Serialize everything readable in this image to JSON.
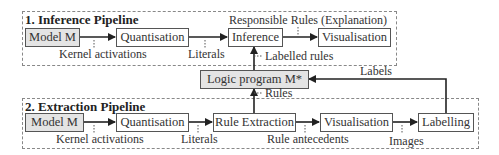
{
  "inference_pipeline": {
    "title": "1. Inference Pipeline",
    "nodes": {
      "model": "Model M",
      "quantisation": "Quantisation",
      "inference": "Inference",
      "visualisation": "Visualisation"
    },
    "edge_labels": {
      "kernel_activations": "Kernel activations",
      "literals": "Literals",
      "responsible_rules": "Responsible Rules (Explanation)"
    }
  },
  "logic_program": {
    "label": "Logic program M*",
    "labelled_rules": "Labelled rules",
    "rules": "Rules",
    "labels": "Labels"
  },
  "extraction_pipeline": {
    "title": "2. Extraction Pipeline",
    "nodes": {
      "model": "Model M",
      "quantisation": "Quantisation",
      "rule_extraction": "Rule Extraction",
      "visualisation": "Visualisation",
      "labelling": "Labelling"
    },
    "edge_labels": {
      "kernel_activations": "Kernel activations",
      "literals": "Literals",
      "rule_antecedents": "Rule antecedents",
      "images": "Images"
    }
  }
}
